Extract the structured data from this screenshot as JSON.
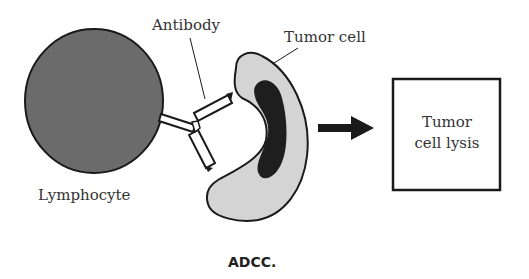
{
  "diagram": {
    "title": "ADCC.",
    "labels": {
      "antibody": "Antibody",
      "tumor_cell": "Tumor cell",
      "lymphocyte": "Lymphocyte"
    },
    "result_box": {
      "line1": "Tumor",
      "line2": "cell lysis"
    },
    "arrow": "right-arrow"
  },
  "colors": {
    "lymphocyte_fill": "#6b6b6b",
    "tumor_cell_fill": "#d4d4d4",
    "nucleus_fill": "#1e1e1e",
    "outline": "#1a1a1a",
    "text": "#333333"
  }
}
